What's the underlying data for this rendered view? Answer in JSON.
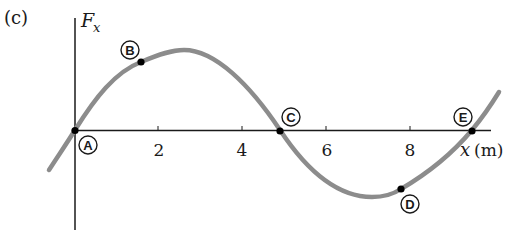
{
  "panel_label": "(c)",
  "axes": {
    "y_label_main": "F",
    "y_label_sub": "x",
    "x_label_var": "x",
    "x_label_unit": "(m)",
    "x_ticks": [
      "2",
      "4",
      "6",
      "8"
    ]
  },
  "points": [
    {
      "id": "A",
      "label": "A",
      "x_m": 0.0,
      "desc": "origin, F = 0"
    },
    {
      "id": "B",
      "label": "B",
      "x_m": 1.6,
      "desc": "positive force"
    },
    {
      "id": "C",
      "label": "C",
      "x_m": 4.9,
      "desc": "F = 0"
    },
    {
      "id": "D",
      "label": "D",
      "x_m": 7.8,
      "desc": "negative force"
    },
    {
      "id": "E",
      "label": "E",
      "x_m": 9.4,
      "desc": "F = 0"
    }
  ],
  "curve": {
    "color": "#8c8c8c",
    "shape": "sinusoid, max near x≈2.5 m, min near x≈7.1 m"
  },
  "colors": {
    "axis": "#1a1a1a",
    "curve": "#8c8c8c",
    "point": "#000000"
  }
}
